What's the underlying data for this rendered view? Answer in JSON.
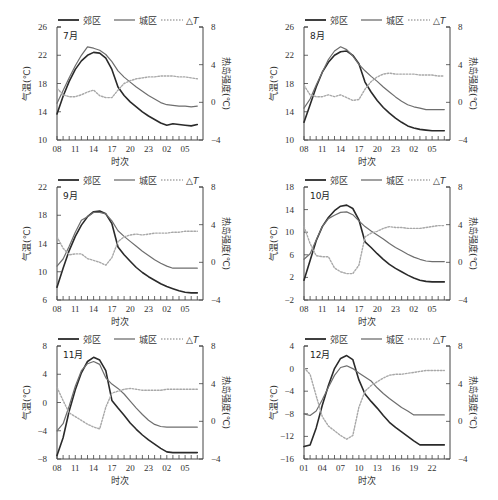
{
  "legend": {
    "suburb": "郊区",
    "urban": "城区",
    "delta": "△T"
  },
  "xlabel": "时次",
  "ylabel_left": "气温(℃)",
  "ylabel_right": "热岛强度(℃)",
  "colors": {
    "suburb": "#2a2a2a",
    "urban": "#6e6e6e",
    "delta": "#a8a8a8",
    "axis": "#444444"
  },
  "chart_data": [
    {
      "type": "line",
      "title": "7月",
      "x": [
        "08",
        "09",
        "10",
        "11",
        "12",
        "13",
        "14",
        "15",
        "16",
        "17",
        "18",
        "19",
        "20",
        "21",
        "22",
        "23",
        "00",
        "01",
        "02",
        "03",
        "04",
        "05",
        "06",
        "07"
      ],
      "xticks": [
        "08",
        "11",
        "14",
        "17",
        "20",
        "23",
        "02",
        "05"
      ],
      "ylim": [
        10,
        26
      ],
      "yticks": [
        10,
        14,
        18,
        22,
        26
      ],
      "y2lim": [
        -4,
        8
      ],
      "y2ticks": [
        -4,
        0,
        4,
        8
      ],
      "series": [
        {
          "name": "郊区",
          "axis": "left",
          "values": [
            13.7,
            16.2,
            18.3,
            20.0,
            21.2,
            22.0,
            22.4,
            22.3,
            21.6,
            20.0,
            17.5,
            16.3,
            15.4,
            14.7,
            14.0,
            13.4,
            12.9,
            12.4,
            12.1,
            12.3,
            12.2,
            12.1,
            12.0,
            12.2
          ]
        },
        {
          "name": "城区",
          "axis": "left",
          "values": [
            15.2,
            17.0,
            18.8,
            20.5,
            22.0,
            23.2,
            23.0,
            22.7,
            22.1,
            21.1,
            19.8,
            18.9,
            18.2,
            17.5,
            16.9,
            16.3,
            15.8,
            15.3,
            15.0,
            14.9,
            14.8,
            14.8,
            14.7,
            14.8
          ]
        },
        {
          "name": "△T",
          "axis": "right",
          "values": [
            1.5,
            0.8,
            0.6,
            0.6,
            0.8,
            1.1,
            1.3,
            0.7,
            0.5,
            0.5,
            1.3,
            2.0,
            2.3,
            2.5,
            2.6,
            2.7,
            2.7,
            2.8,
            2.8,
            2.8,
            2.7,
            2.7,
            2.6,
            2.5
          ]
        }
      ]
    },
    {
      "type": "line",
      "title": "8月",
      "x": [
        "08",
        "09",
        "10",
        "11",
        "12",
        "13",
        "14",
        "15",
        "16",
        "17",
        "18",
        "19",
        "20",
        "21",
        "22",
        "23",
        "00",
        "01",
        "02",
        "03",
        "04",
        "05",
        "06",
        "07"
      ],
      "xticks": [
        "08",
        "11",
        "14",
        "17",
        "20",
        "23",
        "02",
        "05"
      ],
      "ylim": [
        10,
        26
      ],
      "yticks": [
        10,
        14,
        18,
        22,
        26
      ],
      "y2lim": [
        -4,
        8
      ],
      "y2ticks": [
        -4,
        0,
        4,
        8
      ],
      "series": [
        {
          "name": "郊区",
          "axis": "left",
          "values": [
            12.5,
            15.0,
            17.5,
            19.6,
            21.0,
            22.0,
            22.5,
            22.6,
            22.0,
            20.8,
            18.2,
            16.8,
            15.6,
            14.6,
            13.8,
            13.1,
            12.5,
            12.0,
            11.7,
            11.5,
            11.4,
            11.3,
            11.3,
            11.3
          ]
        },
        {
          "name": "城区",
          "axis": "left",
          "values": [
            14.5,
            15.8,
            17.8,
            19.6,
            21.4,
            22.6,
            23.2,
            22.8,
            21.9,
            20.7,
            19.8,
            19.0,
            18.3,
            17.5,
            16.8,
            16.1,
            15.5,
            15.0,
            14.7,
            14.5,
            14.3,
            14.3,
            14.3,
            14.3
          ]
        },
        {
          "name": "△T",
          "axis": "right",
          "values": [
            1.8,
            0.8,
            0.6,
            0.6,
            0.8,
            0.6,
            0.8,
            0.5,
            0.2,
            0.3,
            1.4,
            2.2,
            2.7,
            3.0,
            3.1,
            3.0,
            3.0,
            3.0,
            3.0,
            2.9,
            2.9,
            2.9,
            2.8,
            2.8
          ]
        }
      ]
    },
    {
      "type": "line",
      "title": "9月",
      "x": [
        "08",
        "09",
        "10",
        "11",
        "12",
        "13",
        "14",
        "15",
        "16",
        "17",
        "18",
        "19",
        "20",
        "21",
        "22",
        "23",
        "00",
        "01",
        "02",
        "03",
        "04",
        "05",
        "06",
        "07"
      ],
      "xticks": [
        "08",
        "11",
        "14",
        "17",
        "20",
        "23",
        "02",
        "05"
      ],
      "ylim": [
        6,
        22
      ],
      "yticks": [
        6,
        10,
        14,
        18,
        22
      ],
      "y2lim": [
        -4,
        8
      ],
      "y2ticks": [
        -4,
        0,
        4,
        8
      ],
      "series": [
        {
          "name": "郊区",
          "axis": "left",
          "values": [
            7.8,
            10.5,
            13.0,
            15.0,
            16.6,
            17.8,
            18.5,
            18.6,
            18.2,
            16.8,
            13.5,
            12.4,
            11.5,
            10.6,
            9.9,
            9.3,
            8.8,
            8.3,
            7.9,
            7.6,
            7.3,
            7.1,
            7.0,
            7.0
          ]
        },
        {
          "name": "城区",
          "axis": "left",
          "values": [
            10.8,
            11.8,
            13.6,
            15.6,
            17.3,
            17.8,
            18.4,
            18.4,
            18.2,
            17.2,
            15.8,
            15.0,
            14.3,
            13.6,
            12.9,
            12.3,
            11.7,
            11.2,
            10.8,
            10.5,
            10.5,
            10.5,
            10.5,
            10.5
          ]
        },
        {
          "name": "△T",
          "axis": "right",
          "values": [
            2.7,
            1.5,
            0.8,
            0.9,
            0.9,
            0.4,
            0.2,
            0.0,
            -0.3,
            0.5,
            2.2,
            2.7,
            2.9,
            3.0,
            2.9,
            3.0,
            3.1,
            3.1,
            3.1,
            3.2,
            3.2,
            3.3,
            3.3,
            3.3
          ]
        }
      ]
    },
    {
      "type": "line",
      "title": "10月",
      "x": [
        "08",
        "09",
        "10",
        "11",
        "12",
        "13",
        "14",
        "15",
        "16",
        "17",
        "18",
        "19",
        "20",
        "21",
        "22",
        "23",
        "00",
        "01",
        "02",
        "03",
        "04",
        "05",
        "06",
        "07"
      ],
      "xticks": [
        "08",
        "11",
        "14",
        "17",
        "20",
        "23",
        "02",
        "05"
      ],
      "ylim": [
        -2,
        18
      ],
      "yticks": [
        -2,
        2,
        6,
        10,
        14,
        18
      ],
      "y2lim": [
        -4,
        8
      ],
      "y2ticks": [
        -4,
        0,
        4,
        8
      ],
      "series": [
        {
          "name": "郊区",
          "axis": "left",
          "values": [
            1.5,
            5.0,
            8.5,
            11.0,
            12.6,
            13.8,
            14.6,
            14.8,
            14.2,
            12.2,
            8.3,
            7.3,
            6.2,
            5.2,
            4.3,
            3.6,
            3.0,
            2.4,
            1.9,
            1.5,
            1.3,
            1.2,
            1.2,
            1.2
          ]
        },
        {
          "name": "城区",
          "axis": "left",
          "values": [
            5.2,
            6.2,
            8.6,
            11.0,
            12.4,
            13.0,
            13.5,
            13.6,
            13.1,
            12.0,
            11.0,
            10.2,
            9.5,
            8.8,
            8.0,
            7.3,
            6.7,
            6.1,
            5.6,
            5.2,
            4.9,
            4.8,
            4.8,
            4.8
          ]
        },
        {
          "name": "△T",
          "axis": "right",
          "values": [
            3.8,
            2.0,
            0.7,
            0.6,
            0.6,
            -0.6,
            -1.0,
            -1.2,
            -1.2,
            -0.3,
            2.7,
            3.1,
            3.3,
            3.6,
            3.8,
            3.7,
            3.7,
            3.6,
            3.6,
            3.6,
            3.7,
            3.8,
            3.9,
            3.9
          ]
        }
      ]
    },
    {
      "type": "line",
      "title": "11月",
      "x": [
        "08",
        "09",
        "10",
        "11",
        "12",
        "13",
        "14",
        "15",
        "16",
        "17",
        "18",
        "19",
        "20",
        "21",
        "22",
        "23",
        "00",
        "01",
        "02",
        "03",
        "04",
        "05",
        "06",
        "07"
      ],
      "xticks": [
        "08",
        "11",
        "14",
        "17",
        "20",
        "23",
        "02",
        "05"
      ],
      "ylim": [
        -8,
        8
      ],
      "yticks": [
        -8,
        -4,
        0,
        4,
        8
      ],
      "y2lim": [
        -4,
        8
      ],
      "y2ticks": [
        -4,
        0,
        4,
        8
      ],
      "series": [
        {
          "name": "郊区",
          "axis": "left",
          "values": [
            -7.5,
            -5.0,
            -1.2,
            1.8,
            4.2,
            5.8,
            6.4,
            6.0,
            4.5,
            0.3,
            -0.8,
            -1.8,
            -2.9,
            -3.8,
            -4.6,
            -5.3,
            -5.9,
            -6.5,
            -7.0,
            -7.1,
            -7.1,
            -7.1,
            -7.1,
            -7.1
          ]
        },
        {
          "name": "城区",
          "axis": "left",
          "values": [
            -4.0,
            -3.0,
            -0.5,
            2.3,
            4.5,
            5.5,
            5.8,
            5.4,
            3.5,
            2.6,
            2.0,
            1.2,
            0.2,
            -0.8,
            -1.7,
            -2.5,
            -3.1,
            -3.4,
            -3.5,
            -3.5,
            -3.5,
            -3.5,
            -3.5,
            -3.5
          ]
        },
        {
          "name": "△T",
          "axis": "right",
          "values": [
            3.6,
            2.2,
            0.9,
            0.5,
            0.1,
            -0.3,
            -0.6,
            -0.8,
            1.5,
            3.0,
            3.2,
            3.4,
            3.5,
            3.4,
            3.3,
            3.3,
            3.3,
            3.3,
            3.4,
            3.4,
            3.4,
            3.4,
            3.4,
            3.4
          ]
        }
      ]
    },
    {
      "type": "line",
      "title": "12月",
      "x": [
        "01",
        "02",
        "03",
        "04",
        "05",
        "06",
        "07",
        "08",
        "09",
        "10",
        "11",
        "12",
        "13",
        "14",
        "15",
        "16",
        "17",
        "18",
        "19",
        "20",
        "21",
        "22",
        "23",
        "24"
      ],
      "xticks": [
        "01",
        "04",
        "07",
        "10",
        "13",
        "16",
        "19",
        "22"
      ],
      "ylim": [
        -16,
        4
      ],
      "yticks": [
        -16,
        -12,
        -8,
        -4,
        0,
        4
      ],
      "y2lim": [
        -4,
        8
      ],
      "y2ticks": [
        -4,
        0,
        4,
        8
      ],
      "series": [
        {
          "name": "郊区",
          "axis": "left",
          "values": [
            -13.8,
            -13.5,
            -10.5,
            -6.5,
            -3.0,
            0.0,
            1.8,
            2.3,
            1.6,
            -2.0,
            -4.5,
            -5.8,
            -7.0,
            -8.3,
            -9.5,
            -10.4,
            -11.2,
            -12.0,
            -12.8,
            -13.5,
            -13.5,
            -13.5,
            -13.5,
            -13.5
          ]
        },
        {
          "name": "城区",
          "axis": "left",
          "values": [
            -8.0,
            -8.3,
            -7.5,
            -5.5,
            -3.3,
            -1.2,
            0.2,
            0.5,
            0.0,
            -0.8,
            -1.5,
            -2.2,
            -3.4,
            -4.4,
            -5.3,
            -6.1,
            -6.9,
            -7.5,
            -8.2,
            -8.2,
            -8.2,
            -8.2,
            -8.2,
            -8.2
          ]
        },
        {
          "name": "△T",
          "axis": "right",
          "values": [
            5.7,
            5.0,
            2.7,
            0.5,
            -0.5,
            -1.0,
            -1.5,
            -1.9,
            -1.5,
            1.5,
            3.2,
            3.8,
            4.2,
            4.6,
            4.9,
            5.0,
            5.0,
            5.1,
            5.2,
            5.3,
            5.4,
            5.4,
            5.4,
            5.4
          ]
        }
      ]
    }
  ]
}
